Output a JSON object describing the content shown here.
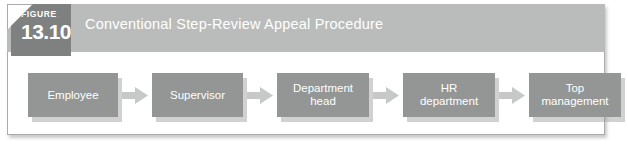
{
  "figure": {
    "badge_word": "FIGURE",
    "badge_number": "13.10",
    "title": "Conventional Step-Review Appeal Procedure",
    "margin_credit": "",
    "colors": {
      "header_band": "#b9bcbb",
      "badge": "#7e8180",
      "node_fill": "#939694",
      "arrow_fill": "#c6c9c8",
      "node_text": "#ffffff",
      "frame_border": "#a9acab",
      "page_background": "#ffffff"
    }
  },
  "flow": {
    "nodes": [
      {
        "label": "Employee",
        "line1": "Employee",
        "line2": ""
      },
      {
        "label": "Supervisor",
        "line1": "Supervisor",
        "line2": ""
      },
      {
        "label": "Department head",
        "line1": "Department",
        "line2": "head"
      },
      {
        "label": "HR department",
        "line1": "HR",
        "line2": "department"
      },
      {
        "label": "Top management",
        "line1": "Top",
        "line2": "management"
      }
    ],
    "arrows": [
      {
        "from": "Employee",
        "to": "Supervisor",
        "direction": "right"
      },
      {
        "from": "Supervisor",
        "to": "Department head",
        "direction": "right"
      },
      {
        "from": "Department head",
        "to": "HR department",
        "direction": "right"
      },
      {
        "from": "HR department",
        "to": "Top management",
        "direction": "right"
      }
    ]
  }
}
